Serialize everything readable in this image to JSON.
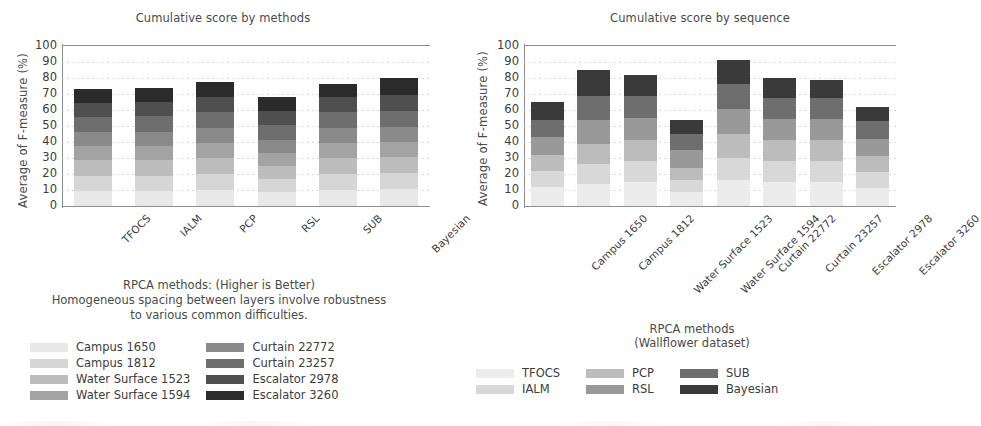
{
  "chart_data": [
    {
      "id": "left",
      "type": "bar",
      "stacked": true,
      "title": "Cumulative score by methods",
      "xlabel": "",
      "ylabel": "Average  of  F-measure   (%)",
      "ylim": [
        0,
        100
      ],
      "yticks": [
        0,
        10,
        20,
        30,
        40,
        50,
        60,
        70,
        80,
        90,
        100
      ],
      "grid": true,
      "legend_position": "bottom",
      "categories": [
        "TFOCS",
        "IALM",
        "PCP",
        "RSL",
        "SUB",
        "Bayesian"
      ],
      "series": [
        {
          "name": "Campus 1650",
          "color": "#e8e8e8",
          "values": [
            9.5,
            9.5,
            10.0,
            8.5,
            10.0,
            10.5
          ]
        },
        {
          "name": "Campus 1812",
          "color": "#d6d6d6",
          "values": [
            9.5,
            9.5,
            10.0,
            8.5,
            10.0,
            10.0
          ]
        },
        {
          "name": "Water Surface 1523",
          "color": "#bcbcbc",
          "values": [
            9.5,
            9.5,
            10.0,
            8.0,
            10.0,
            10.0
          ]
        },
        {
          "name": "Water Surface 1594",
          "color": "#a3a3a3",
          "values": [
            9.0,
            9.0,
            9.5,
            8.0,
            9.5,
            9.5
          ]
        },
        {
          "name": "Curtain 22772",
          "color": "#8a8a8a",
          "values": [
            9.0,
            9.0,
            9.5,
            8.5,
            9.5,
            9.5
          ]
        },
        {
          "name": "Curtain 23257",
          "color": "#6e6e6e",
          "values": [
            9.0,
            9.5,
            9.5,
            9.0,
            9.5,
            10.0
          ]
        },
        {
          "name": "Escalator 2978",
          "color": "#4f4f4f",
          "values": [
            9.0,
            9.0,
            9.5,
            9.0,
            9.5,
            10.0
          ]
        },
        {
          "name": "Escalator 3260",
          "color": "#2b2b2b",
          "values": [
            8.5,
            8.5,
            9.5,
            8.5,
            8.5,
            10.5
          ]
        }
      ],
      "totals": [
        73,
        74,
        77.5,
        68,
        76.5,
        80
      ],
      "caption": [
        "RPCA methods: (Higher is Better)",
        "Homogeneous spacing between layers involve robustness",
        "to various common difficulties."
      ]
    },
    {
      "id": "right",
      "type": "bar",
      "stacked": true,
      "title": "Cumulative score by sequence",
      "xlabel": "",
      "ylabel": "Average  of  F-measure  (%)",
      "ylim": [
        0,
        100
      ],
      "yticks": [
        0,
        10,
        20,
        30,
        40,
        50,
        60,
        70,
        80,
        90,
        100
      ],
      "grid": true,
      "legend_position": "bottom",
      "legend_title": [
        "RPCA methods",
        "(Wallflower dataset)"
      ],
      "categories": [
        "Campus 1650",
        "Campus 1812",
        "Water Surface 1523",
        "Water Surface 1594",
        "Curtain 22772",
        "Curtain 23257",
        "Escalator 2978",
        "Escalator 3260"
      ],
      "series": [
        {
          "name": "TFOCS",
          "color": "#ececec",
          "values": [
            12.0,
            14.0,
            15.0,
            9.0,
            16.0,
            15.0,
            15.0,
            11.0
          ]
        },
        {
          "name": "IALM",
          "color": "#d8d8d8",
          "values": [
            10.0,
            12.0,
            13.0,
            7.0,
            14.0,
            13.0,
            13.0,
            10.0
          ]
        },
        {
          "name": "PCP",
          "color": "#bcbcbc",
          "values": [
            10.0,
            13.0,
            13.0,
            8.0,
            15.0,
            13.5,
            13.5,
            10.0
          ]
        },
        {
          "name": "RSL",
          "color": "#999999",
          "values": [
            11.0,
            15.0,
            14.0,
            11.0,
            15.5,
            13.0,
            13.0,
            11.0
          ]
        },
        {
          "name": "SUB",
          "color": "#6e6e6e",
          "values": [
            11.0,
            15.0,
            14.0,
            10.0,
            15.5,
            13.0,
            13.0,
            11.0
          ]
        },
        {
          "name": "Bayesian",
          "color": "#3a3a3a",
          "values": [
            11.0,
            16.0,
            13.0,
            9.0,
            15.0,
            12.5,
            11.5,
            9.0
          ]
        }
      ],
      "totals": [
        65,
        85,
        82,
        54,
        91,
        80,
        79,
        62
      ]
    }
  ]
}
